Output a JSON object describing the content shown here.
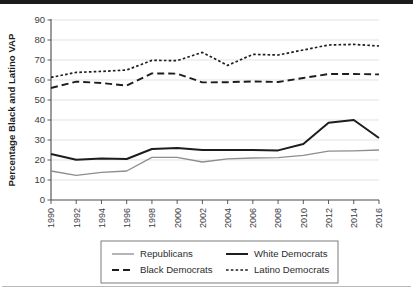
{
  "figure": {
    "background_color": "#ffffff",
    "page_edge_color": "#1c1c1c",
    "rule_color": "#b9b9bb"
  },
  "chart_data": {
    "type": "line",
    "title": "",
    "xlabel": "",
    "ylabel": "Percentage Black and Latino VAP",
    "x": [
      1990,
      1992,
      1994,
      1996,
      1998,
      2000,
      2002,
      2004,
      2006,
      2008,
      2010,
      2012,
      2014,
      2016
    ],
    "categories": [
      "1990",
      "1992",
      "1994",
      "1996",
      "1998",
      "2000",
      "2002",
      "2004",
      "2006",
      "2008",
      "2010",
      "2012",
      "2014",
      "2016"
    ],
    "xlim": [
      1990,
      2016
    ],
    "ylim": [
      0,
      90
    ],
    "yticks": [
      0,
      10,
      20,
      30,
      40,
      50,
      60,
      70,
      80,
      90
    ],
    "ytick_labels": [
      "0",
      "10",
      "20",
      "30",
      "40",
      "50",
      "60",
      "70",
      "80",
      "90"
    ],
    "grid": true,
    "grid_axis": "y",
    "legend_position": "below-center",
    "series": [
      {
        "name": "Republicans",
        "values": [
          14.5,
          12.3,
          13.8,
          14.5,
          21.3,
          21.3,
          19.0,
          20.6,
          21.0,
          21.2,
          22.3,
          24.4,
          24.6,
          25.0
        ],
        "color": "#8d8d90",
        "width": 1.3,
        "dash": "none"
      },
      {
        "name": "White Democrats",
        "values": [
          23.0,
          20.1,
          20.8,
          20.5,
          25.5,
          26.0,
          25.0,
          25.0,
          25.0,
          24.8,
          28.0,
          38.6,
          40.0,
          31.0
        ],
        "color": "#1d1d1f",
        "width": 2.0,
        "dash": "none"
      },
      {
        "name": "Black Democrats",
        "values": [
          56.0,
          59.2,
          58.5,
          57.2,
          63.3,
          63.2,
          58.8,
          58.9,
          59.3,
          59.0,
          61.0,
          63.0,
          63.0,
          62.8
        ],
        "color": "#1d1d1f",
        "width": 1.9,
        "dash": "7,4"
      },
      {
        "name": "Latino Democrats",
        "values": [
          61.3,
          63.8,
          64.3,
          65.0,
          69.8,
          69.7,
          73.8,
          67.3,
          72.8,
          72.5,
          75.0,
          77.5,
          77.8,
          77.0
        ],
        "color": "#1d1d1f",
        "width": 1.7,
        "dash": "2.6,2.2"
      }
    ]
  },
  "legend": {
    "entries": [
      {
        "label": "Republicans",
        "series": "Republicans"
      },
      {
        "label": "White Democrats",
        "series": "White Democrats"
      },
      {
        "label": "Black Democrats",
        "series": "Black Democrats"
      },
      {
        "label": "Latino Democrats",
        "series": "Latino Democrats"
      }
    ]
  }
}
